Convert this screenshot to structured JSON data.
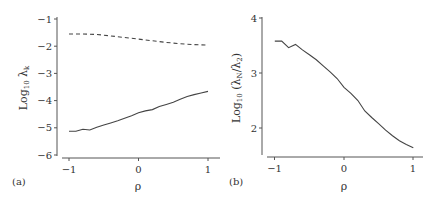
{
  "chart_data": [
    {
      "panel": "(a)",
      "type": "line",
      "title": "",
      "xlabel": "ρ",
      "ylabel": "Log10 λk",
      "xlim": [
        -1,
        1
      ],
      "ylim": [
        -6,
        -1
      ],
      "xticks": [
        -1,
        0,
        1
      ],
      "yticks": [
        -1,
        -2,
        -3,
        -4,
        -5,
        -6
      ],
      "grid": false,
      "legend": null,
      "series": [
        {
          "name": "dashed",
          "style": "dashed",
          "x": [
            -1.0,
            -0.8,
            -0.6,
            -0.4,
            -0.2,
            0.0,
            0.2,
            0.4,
            0.6,
            0.8,
            1.0
          ],
          "values": [
            -1.55,
            -1.55,
            -1.57,
            -1.62,
            -1.68,
            -1.74,
            -1.8,
            -1.86,
            -1.91,
            -1.94,
            -1.96
          ]
        },
        {
          "name": "solid",
          "style": "solid",
          "x": [
            -1.0,
            -0.9,
            -0.8,
            -0.7,
            -0.6,
            -0.5,
            -0.4,
            -0.3,
            -0.2,
            -0.1,
            0.0,
            0.1,
            0.2,
            0.3,
            0.4,
            0.5,
            0.6,
            0.7,
            0.8,
            0.9,
            1.0
          ],
          "values": [
            -5.13,
            -5.13,
            -5.05,
            -5.08,
            -4.98,
            -4.9,
            -4.82,
            -4.74,
            -4.65,
            -4.56,
            -4.45,
            -4.38,
            -4.33,
            -4.22,
            -4.14,
            -4.06,
            -3.95,
            -3.85,
            -3.78,
            -3.72,
            -3.66
          ]
        }
      ]
    },
    {
      "panel": "(b)",
      "type": "line",
      "title": "",
      "xlabel": "ρ",
      "ylabel": "Log10 (λN/λ2)",
      "xlim": [
        -1,
        1
      ],
      "ylim": [
        1.5,
        4
      ],
      "xticks": [
        -1,
        0,
        1
      ],
      "yticks": [
        2,
        3,
        4
      ],
      "grid": false,
      "legend": null,
      "series": [
        {
          "name": "solid",
          "style": "solid",
          "x": [
            -1.0,
            -0.9,
            -0.8,
            -0.7,
            -0.6,
            -0.5,
            -0.4,
            -0.3,
            -0.2,
            -0.1,
            0.0,
            0.1,
            0.2,
            0.3,
            0.4,
            0.5,
            0.6,
            0.7,
            0.8,
            0.9,
            1.0
          ],
          "values": [
            3.58,
            3.58,
            3.46,
            3.52,
            3.42,
            3.33,
            3.24,
            3.13,
            3.02,
            2.9,
            2.74,
            2.63,
            2.5,
            2.31,
            2.19,
            2.08,
            1.96,
            1.86,
            1.77,
            1.7,
            1.64
          ]
        }
      ]
    }
  ],
  "labels": {
    "a": {
      "panel": "(a)",
      "xlabel": "ρ",
      "ylabel_base": "Log",
      "ylabel_sub": "10",
      "ylabel_var": " λ",
      "ylabel_var_sub": "k",
      "xticks": [
        "−1",
        "0",
        "1"
      ],
      "yticks": [
        "−1",
        "−2",
        "−3",
        "−4",
        "−5",
        "−6"
      ]
    },
    "b": {
      "panel": "(b)",
      "xlabel": "ρ",
      "ylabel_base": "Log",
      "ylabel_sub": "10",
      "ylabel_var": " (λ",
      "ylabel_var_sub": "N",
      "ylabel_var2": "/λ",
      "ylabel_var2_sub": "2",
      "ylabel_close": ")",
      "xticks": [
        "−1",
        "0",
        "1"
      ],
      "yticks": [
        "4",
        "3",
        "2"
      ]
    }
  },
  "colors": {
    "line": "#444444",
    "axis": "#555555",
    "text": "#333333"
  }
}
